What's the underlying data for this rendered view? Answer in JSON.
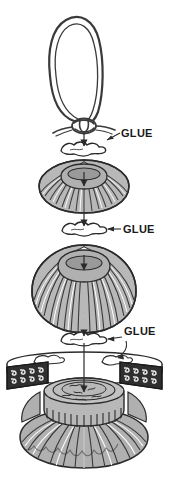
{
  "diagram": {
    "background_color": "#ffffff",
    "ink_color": "#2b2b2b",
    "fill_gray": "#a8a8a8",
    "fill_light": "#d9d9d9",
    "fill_dark": "#3a3a3a",
    "width": 169,
    "height": 478
  },
  "labels": {
    "glue_1": "GLUE",
    "glue_2": "GLUE",
    "glue_3": "GLUE"
  },
  "parts": [
    {
      "id": "cord-loop",
      "name": "knotted cord loop",
      "order": 1
    },
    {
      "id": "knot",
      "name": "overhand knot",
      "order": 2
    },
    {
      "id": "glue-blob-1",
      "name": "glue blob",
      "order": 3
    },
    {
      "id": "small-bead",
      "name": "small ribbed bead",
      "order": 4
    },
    {
      "id": "glue-blob-2",
      "name": "glue blob",
      "order": 5
    },
    {
      "id": "large-bead",
      "name": "large ribbed bead",
      "order": 6
    },
    {
      "id": "glue-blob-3",
      "name": "glue blob",
      "order": 7
    },
    {
      "id": "patterned-disc",
      "name": "patterned disc with scroll border",
      "order": 8
    },
    {
      "id": "tassel-base",
      "name": "pleated tassel base with toothed cap",
      "order": 9
    }
  ]
}
